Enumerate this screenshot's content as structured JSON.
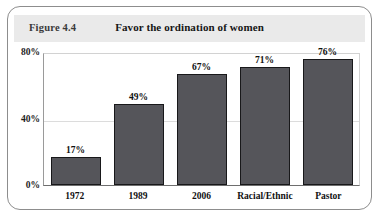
{
  "figure": {
    "number_label": "Figure 4.4"
  },
  "chart_data": {
    "type": "bar",
    "title": "Favor the ordination of women",
    "xlabel": "",
    "ylabel": "",
    "categories": [
      "1972",
      "1989",
      "2006",
      "Racial/Ethnic",
      "Pastor"
    ],
    "values": [
      17,
      49,
      67,
      71,
      76
    ],
    "value_labels": [
      "17%",
      "49%",
      "67%",
      "71%",
      "76%"
    ],
    "ylim": [
      0,
      80
    ],
    "yticks": [
      0,
      40,
      80
    ],
    "ytick_labels": [
      "0%",
      "40%",
      "80%"
    ],
    "grid": true,
    "legend": null,
    "bar_color": "#55555a",
    "bar_border_color": "#18181a"
  }
}
